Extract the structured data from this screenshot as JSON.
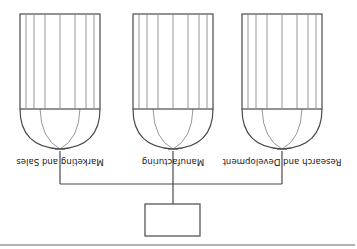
{
  "diagram": {
    "orientation": "rotated-180",
    "root": {
      "label": ""
    },
    "departments": [
      {
        "label": "Research and Development",
        "stem_x": 75,
        "box_x": 35
      },
      {
        "label": "Manufacturing",
        "stem_x": 184,
        "box_x": 144
      },
      {
        "label": "Marketing and Sales",
        "stem_x": 297,
        "box_x": 257
      }
    ],
    "colors": {
      "line": "#4a4a4a",
      "inner_line": "#8a8a8a",
      "rule": "#9a9a9a",
      "text": "#222222"
    }
  }
}
